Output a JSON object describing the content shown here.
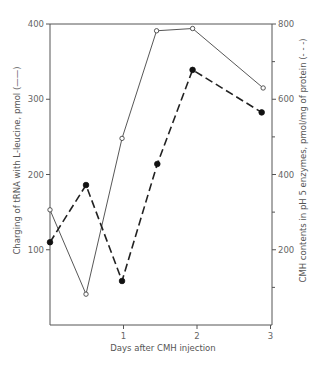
{
  "chart_data": {
    "type": "line",
    "title": "",
    "xlabel": "Days after CMH injection",
    "ylabel": "Charging of tRNA with L-leucine, pmol (——)",
    "y2label": "CMH contents in pH 5 enzymes, pmol/mg of protein (- - -)",
    "xlim": [
      0,
      3
    ],
    "ylim": [
      0,
      400
    ],
    "y2lim": [
      0,
      800
    ],
    "x_ticks": [
      1,
      2,
      3
    ],
    "x_tick_labels": [
      "1",
      "2",
      "3"
    ],
    "y_ticks": [
      100,
      200,
      300,
      400
    ],
    "y_tick_labels": [
      "100",
      "200",
      "300",
      "400"
    ],
    "y2_ticks_major": [
      200,
      400,
      600,
      800
    ],
    "y2_tick_labels": [
      "200",
      "400",
      "600",
      "800"
    ],
    "y2_ticks_minor": [
      100,
      300,
      500,
      700
    ],
    "grid": false,
    "legend": "none (line styles indicated in axis titles)",
    "series": [
      {
        "name": "Charging of tRNA with L-leucine",
        "axis": "left",
        "line_style": "solid",
        "marker": "open-circle",
        "x": [
          0,
          0.49,
          0.98,
          1.45,
          1.94,
          2.9
        ],
        "y": [
          153,
          41,
          248,
          391,
          394,
          315
        ]
      },
      {
        "name": "CMH contents in pH 5 enzymes",
        "axis": "right",
        "line_style": "dashed",
        "marker": "filled-circle",
        "x": [
          0,
          0.49,
          0.98,
          1.46,
          1.94,
          2.88
        ],
        "y": [
          220,
          372,
          117,
          428,
          678,
          565
        ]
      }
    ]
  }
}
